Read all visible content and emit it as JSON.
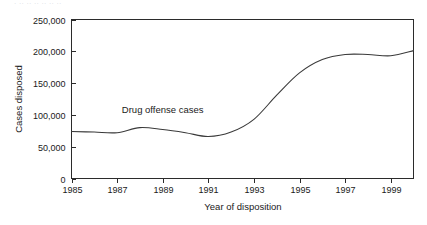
{
  "caption_strip": {
    "text": "· ·· ·· ·· ·· ·· ··"
  },
  "chart_data": {
    "type": "line",
    "title": "",
    "subtitle": "",
    "xlabel": "Year of disposition",
    "ylabel": "Cases disposed",
    "xlim": [
      1985,
      2000
    ],
    "ylim": [
      0,
      250000
    ],
    "grid": false,
    "legend_position": "inline-annotation",
    "x_tick_labels": [
      "1985",
      "1987",
      "1989",
      "1991",
      "1993",
      "1995",
      "1997",
      "1999"
    ],
    "x_tick_values": [
      1985,
      1987,
      1989,
      1991,
      1993,
      1995,
      1997,
      1999
    ],
    "y_tick_labels": [
      "0",
      "50,000",
      "100,000",
      "150,000",
      "200,000",
      "250,000"
    ],
    "y_tick_values": [
      0,
      50000,
      100000,
      150000,
      200000,
      250000
    ],
    "annotations": [
      {
        "text": "Drug offense cases",
        "x": 1989,
        "y": 103000
      }
    ],
    "series": [
      {
        "name": "Drug offense cases",
        "color": "#3a3a3a",
        "x": [
          1985,
          1986,
          1987,
          1988,
          1989,
          1990,
          1991,
          1992,
          1993,
          1994,
          1995,
          1996,
          1997,
          1998,
          1999,
          2000
        ],
        "values": [
          74000,
          73000,
          72000,
          80000,
          77000,
          72000,
          66000,
          73000,
          93000,
          131000,
          166000,
          187000,
          195000,
          195000,
          193000,
          201000
        ]
      }
    ]
  },
  "colors": {
    "line": "#3a3a3a",
    "axis": "#2b2b2b",
    "text": "#1a1a1a",
    "background": "#ffffff"
  }
}
